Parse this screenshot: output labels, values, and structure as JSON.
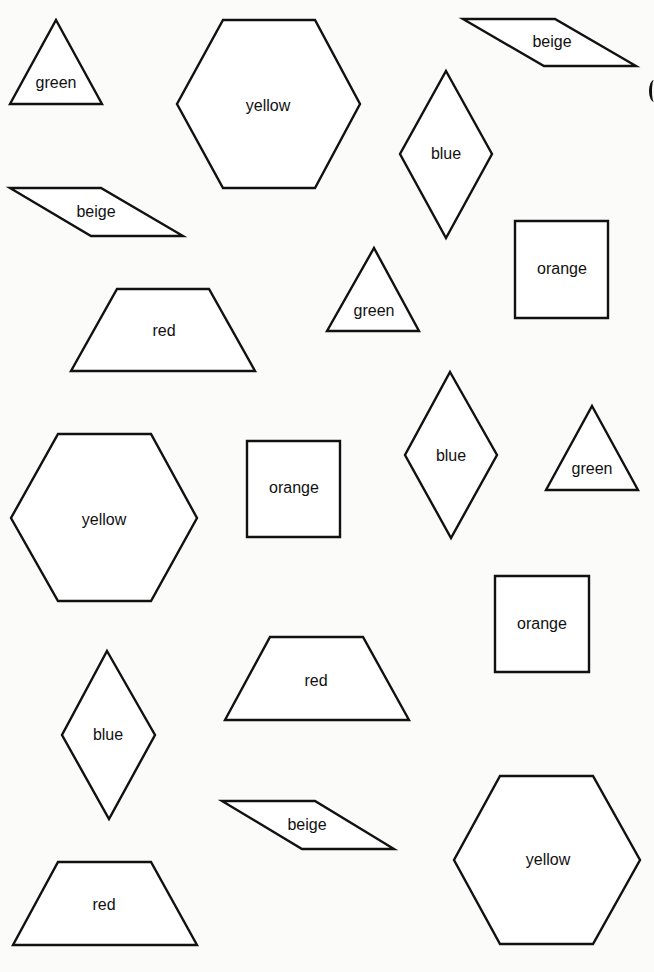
{
  "worksheet": {
    "shapes": [
      {
        "type": "triangle",
        "label": "green",
        "points": [
          [
            56,
            20
          ],
          [
            102,
            104
          ],
          [
            10,
            104
          ]
        ],
        "label_pos": [
          56,
          83
        ]
      },
      {
        "type": "hexagon",
        "label": "yellow",
        "points": [
          [
            223,
            20
          ],
          [
            315,
            20
          ],
          [
            360,
            104
          ],
          [
            315,
            188
          ],
          [
            223,
            188
          ],
          [
            177,
            104
          ]
        ],
        "label_pos": [
          268,
          106
        ]
      },
      {
        "type": "parallelogram",
        "label": "beige",
        "points": [
          [
            463,
            19
          ],
          [
            555,
            19
          ],
          [
            636,
            66
          ],
          [
            544,
            66
          ]
        ],
        "label_pos": [
          552,
          42
        ]
      },
      {
        "type": "rhombus",
        "label": "blue",
        "points": [
          [
            446,
            71
          ],
          [
            492,
            154
          ],
          [
            446,
            238
          ],
          [
            400,
            154
          ]
        ],
        "label_pos": [
          446,
          154
        ]
      },
      {
        "type": "parallelogram",
        "label": "beige",
        "points": [
          [
            10,
            188
          ],
          [
            101,
            188
          ],
          [
            183,
            236
          ],
          [
            91,
            236
          ]
        ],
        "label_pos": [
          96,
          212
        ]
      },
      {
        "type": "square",
        "label": "orange",
        "points": [
          [
            515,
            221
          ],
          [
            608,
            221
          ],
          [
            608,
            318
          ],
          [
            515,
            318
          ]
        ],
        "label_pos": [
          562,
          269
        ]
      },
      {
        "type": "triangle",
        "label": "green",
        "points": [
          [
            374,
            248
          ],
          [
            419,
            331
          ],
          [
            327,
            331
          ]
        ],
        "label_pos": [
          374,
          311
        ]
      },
      {
        "type": "trapezoid",
        "label": "red",
        "points": [
          [
            117,
            289
          ],
          [
            209,
            289
          ],
          [
            255,
            371
          ],
          [
            71,
            371
          ]
        ],
        "label_pos": [
          164,
          331
        ]
      },
      {
        "type": "rhombus",
        "label": "blue",
        "points": [
          [
            450,
            372
          ],
          [
            497,
            455
          ],
          [
            451,
            538
          ],
          [
            405,
            455
          ]
        ],
        "label_pos": [
          451,
          456
        ]
      },
      {
        "type": "triangle",
        "label": "green",
        "points": [
          [
            592,
            406
          ],
          [
            638,
            490
          ],
          [
            546,
            490
          ]
        ],
        "label_pos": [
          592,
          469
        ]
      },
      {
        "type": "hexagon",
        "label": "yellow",
        "points": [
          [
            58,
            434
          ],
          [
            151,
            434
          ],
          [
            197,
            518
          ],
          [
            151,
            601
          ],
          [
            58,
            601
          ],
          [
            11,
            518
          ]
        ],
        "label_pos": [
          104,
          520
        ]
      },
      {
        "type": "square",
        "label": "orange",
        "points": [
          [
            247,
            441
          ],
          [
            340,
            441
          ],
          [
            340,
            537
          ],
          [
            247,
            537
          ]
        ],
        "label_pos": [
          294,
          488
        ]
      },
      {
        "type": "square",
        "label": "orange",
        "points": [
          [
            495,
            576
          ],
          [
            589,
            576
          ],
          [
            589,
            672
          ],
          [
            495,
            672
          ]
        ],
        "label_pos": [
          542,
          624
        ]
      },
      {
        "type": "trapezoid",
        "label": "red",
        "points": [
          [
            270,
            637
          ],
          [
            363,
            637
          ],
          [
            409,
            720
          ],
          [
            225,
            720
          ]
        ],
        "label_pos": [
          316,
          681
        ]
      },
      {
        "type": "rhombus",
        "label": "blue",
        "points": [
          [
            107,
            651
          ],
          [
            155,
            735
          ],
          [
            109,
            819
          ],
          [
            62,
            735
          ]
        ],
        "label_pos": [
          108,
          735
        ]
      },
      {
        "type": "parallelogram",
        "label": "beige",
        "points": [
          [
            222,
            801
          ],
          [
            315,
            801
          ],
          [
            394,
            849
          ],
          [
            302,
            849
          ]
        ],
        "label_pos": [
          307,
          825
        ]
      },
      {
        "type": "hexagon",
        "label": "yellow",
        "points": [
          [
            500,
            776
          ],
          [
            593,
            776
          ],
          [
            640,
            860
          ],
          [
            593,
            944
          ],
          [
            500,
            944
          ],
          [
            454,
            860
          ]
        ],
        "label_pos": [
          548,
          860
        ]
      },
      {
        "type": "trapezoid",
        "label": "red",
        "points": [
          [
            58,
            862
          ],
          [
            151,
            862
          ],
          [
            197,
            945
          ],
          [
            13,
            945
          ]
        ],
        "label_pos": [
          104,
          905
        ]
      }
    ]
  }
}
